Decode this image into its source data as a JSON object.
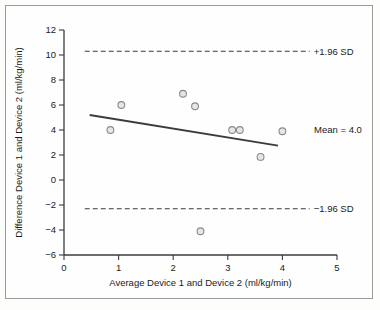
{
  "figure": {
    "background_color": "#fefefe",
    "border_color": "#9a9a96"
  },
  "chart_data": {
    "type": "scatter",
    "title": "",
    "subtitle": "",
    "xlabel": "Average Device 1 and Device 2 (ml/kg/min)",
    "ylabel": "Difference Device 1 and Device 2 (ml/kg/min)",
    "xlim": [
      0,
      5
    ],
    "ylim": [
      -6,
      12
    ],
    "xticks": [
      0,
      1,
      2,
      3,
      4,
      5
    ],
    "yticks": [
      -6,
      -4,
      -2,
      0,
      2,
      4,
      6,
      8,
      10,
      12
    ],
    "xtick_labels": [
      "0",
      "1",
      "2",
      "3",
      "4",
      "5"
    ],
    "ytick_labels": [
      "−6",
      "−4",
      "−2",
      "0",
      "2",
      "4",
      "6",
      "8",
      "10",
      "12"
    ],
    "grid": false,
    "legend": "none",
    "marker_color": "#8a8a8a",
    "marker_fill": "#e6e6e6",
    "line_color": "#3b3b3b",
    "x": [
      0.85,
      1.05,
      2.18,
      2.4,
      2.5,
      3.08,
      3.22,
      3.6,
      4.0
    ],
    "y": [
      4.0,
      6.0,
      6.9,
      5.9,
      -4.1,
      4.0,
      4.0,
      1.85,
      3.9
    ],
    "points": [
      {
        "x": 0.85,
        "y": 4.0
      },
      {
        "x": 1.05,
        "y": 6.0
      },
      {
        "x": 2.18,
        "y": 6.9
      },
      {
        "x": 2.4,
        "y": 5.9
      },
      {
        "x": 2.5,
        "y": -4.1
      },
      {
        "x": 3.08,
        "y": 4.0
      },
      {
        "x": 3.22,
        "y": 4.0
      },
      {
        "x": 3.6,
        "y": 1.85
      },
      {
        "x": 4.0,
        "y": 3.9
      }
    ],
    "reference_lines": [
      {
        "name": "upper-limit-of-agreement",
        "label": "+1.96 SD",
        "value": 10.3,
        "style": "dashed",
        "x_start": 0.38,
        "x_end": 4.5
      },
      {
        "name": "lower-limit-of-agreement",
        "label": "−1.96 SD",
        "value": -2.3,
        "style": "dashed",
        "x_start": 0.38,
        "x_end": 4.5
      }
    ],
    "trend_line": {
      "name": "regression-line",
      "label": "Mean = 4.0",
      "style": "solid",
      "x_start": 0.47,
      "y_start": 5.2,
      "x_end": 3.92,
      "y_end": 2.75
    },
    "annotations": [
      {
        "name": "mean-label",
        "text": "Mean = 4.0",
        "x": 4.58,
        "y": 4.0
      },
      {
        "name": "upper-sd-label",
        "text": "+1.96 SD",
        "x": 4.62,
        "y": 10.3
      },
      {
        "name": "lower-sd-label",
        "text": "−1.96 SD",
        "x": 4.62,
        "y": -2.3
      }
    ]
  }
}
